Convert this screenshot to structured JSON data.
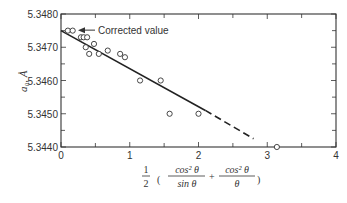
{
  "chart_data": {
    "type": "scatter",
    "title": "",
    "xlabel": "1/2 (cos²θ / sin θ + cos²θ / θ)",
    "xlabel_parts": {
      "half_num": "1",
      "half_den": "2",
      "frac1_num": "cos² θ",
      "frac1_den": "sin θ",
      "plus": "+",
      "frac2_num": "cos² θ",
      "frac2_den": "θ",
      "lparen": "(",
      "rparen": ")"
    },
    "ylabel": "a₀, Å",
    "xlim": [
      0,
      4
    ],
    "ylim": [
      5.344,
      5.348
    ],
    "x_ticks": [
      0,
      1,
      2,
      3,
      4
    ],
    "x_tick_labels": [
      "0",
      "1",
      "2",
      "3",
      "4"
    ],
    "x_minor_ticks": [
      0.5,
      1.5,
      2.5,
      3.5
    ],
    "y_ticks": [
      5.344,
      5.345,
      5.346,
      5.347,
      5.348
    ],
    "y_tick_labels": [
      "5.3440",
      "5.3450",
      "5.3460",
      "5.3470",
      "5.3480"
    ],
    "y_minor_ticks": [
      5.3445,
      5.3455,
      5.3465,
      5.3475
    ],
    "grid": false,
    "series": [
      {
        "name": "measured",
        "marker": "open-circle",
        "points": [
          [
            0.1,
            5.3475
          ],
          [
            0.17,
            5.3475
          ],
          [
            0.29,
            5.3473
          ],
          [
            0.33,
            5.3473
          ],
          [
            0.38,
            5.3473
          ],
          [
            0.48,
            5.3471
          ],
          [
            0.36,
            5.347
          ],
          [
            0.41,
            5.3468
          ],
          [
            0.55,
            5.3468
          ],
          [
            0.68,
            5.3469
          ],
          [
            0.86,
            5.3468
          ],
          [
            0.93,
            5.3467
          ],
          [
            1.15,
            5.346
          ],
          [
            1.45,
            5.346
          ],
          [
            1.58,
            5.345
          ],
          [
            2.0,
            5.345
          ],
          [
            3.14,
            5.344
          ]
        ]
      }
    ],
    "fit_line": {
      "solid": [
        [
          0,
          5.3475
        ],
        [
          2.1,
          5.3451
        ]
      ],
      "dashed": [
        [
          2.1,
          5.3451
        ],
        [
          2.8,
          5.34425
        ]
      ]
    },
    "annotation": {
      "text": "Corrected value",
      "target": [
        0,
        5.3475
      ],
      "arrow": "left"
    }
  }
}
